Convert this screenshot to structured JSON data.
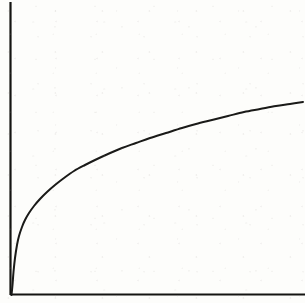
{
  "figure": {
    "kind": "line-plot",
    "background_color": "#fdfdfb",
    "ink_color": "#1a1a18",
    "width": 305,
    "height": 303,
    "has_title": false,
    "has_tick_labels": false,
    "has_legend": false,
    "has_gridlines": false,
    "title": "",
    "subtitle": "",
    "alt_text": "Hand drawn plot showing a concave increasing curve rising steeply from the origin then flattening toward the right, with plain unlabeled x and y axes."
  },
  "axes": {
    "y_axis": {
      "name": "y-axis",
      "label": "",
      "color": "#141412",
      "stroke_width": 2.2,
      "x": 10.5,
      "y_top": 2,
      "y_bottom": 295,
      "has_arrowhead": false,
      "has_ticks": false
    },
    "x_axis": {
      "name": "x-axis",
      "label": "",
      "color": "#141412",
      "stroke_width": 2.0,
      "y": 294.5,
      "x_left": 10.5,
      "x_right": 305,
      "has_arrowhead": false,
      "has_ticks": false
    },
    "origin": {
      "x": 11,
      "y": 294
    }
  },
  "chart_data": {
    "type": "line",
    "title": "",
    "subtitle": "",
    "xlabel": "",
    "ylabel": "",
    "xlim": [
      0,
      305
    ],
    "ylim": [
      0,
      303
    ],
    "grid": false,
    "legend": null,
    "legend_position": "none",
    "tick_labels": {
      "x": [],
      "y": []
    },
    "annotations": [],
    "series": [
      {
        "name": "concave-increasing-curve",
        "shape": "logarithmic-saturating",
        "color": "#1a1a18",
        "stroke_width": 2.0,
        "dashed": false,
        "markers": false,
        "comment": "Pixel coordinates in image space: x rightward, y downward from top-left.",
        "points_px": [
          {
            "x": 11.5,
            "y": 295
          },
          {
            "x": 12.5,
            "y": 285
          },
          {
            "x": 13.5,
            "y": 272
          },
          {
            "x": 15,
            "y": 258
          },
          {
            "x": 17,
            "y": 245
          },
          {
            "x": 19,
            "y": 236
          },
          {
            "x": 22,
            "y": 227
          },
          {
            "x": 25,
            "y": 220
          },
          {
            "x": 29,
            "y": 213
          },
          {
            "x": 34,
            "y": 206
          },
          {
            "x": 40,
            "y": 199
          },
          {
            "x": 47,
            "y": 192
          },
          {
            "x": 55,
            "y": 185
          },
          {
            "x": 64,
            "y": 178
          },
          {
            "x": 74,
            "y": 171
          },
          {
            "x": 85,
            "y": 165
          },
          {
            "x": 95,
            "y": 160
          },
          {
            "x": 108,
            "y": 154
          },
          {
            "x": 122,
            "y": 148
          },
          {
            "x": 136,
            "y": 143
          },
          {
            "x": 150,
            "y": 138
          },
          {
            "x": 166,
            "y": 133
          },
          {
            "x": 182,
            "y": 128
          },
          {
            "x": 196,
            "y": 124
          },
          {
            "x": 212,
            "y": 120
          },
          {
            "x": 228,
            "y": 116
          },
          {
            "x": 244,
            "y": 112
          },
          {
            "x": 260,
            "y": 109
          },
          {
            "x": 276,
            "y": 106
          },
          {
            "x": 290,
            "y": 104
          },
          {
            "x": 303,
            "y": 102
          }
        ],
        "start_point_px": {
          "x": 11.5,
          "y": 295
        },
        "end_point_px": {
          "x": 303,
          "y": 102
        }
      }
    ]
  }
}
